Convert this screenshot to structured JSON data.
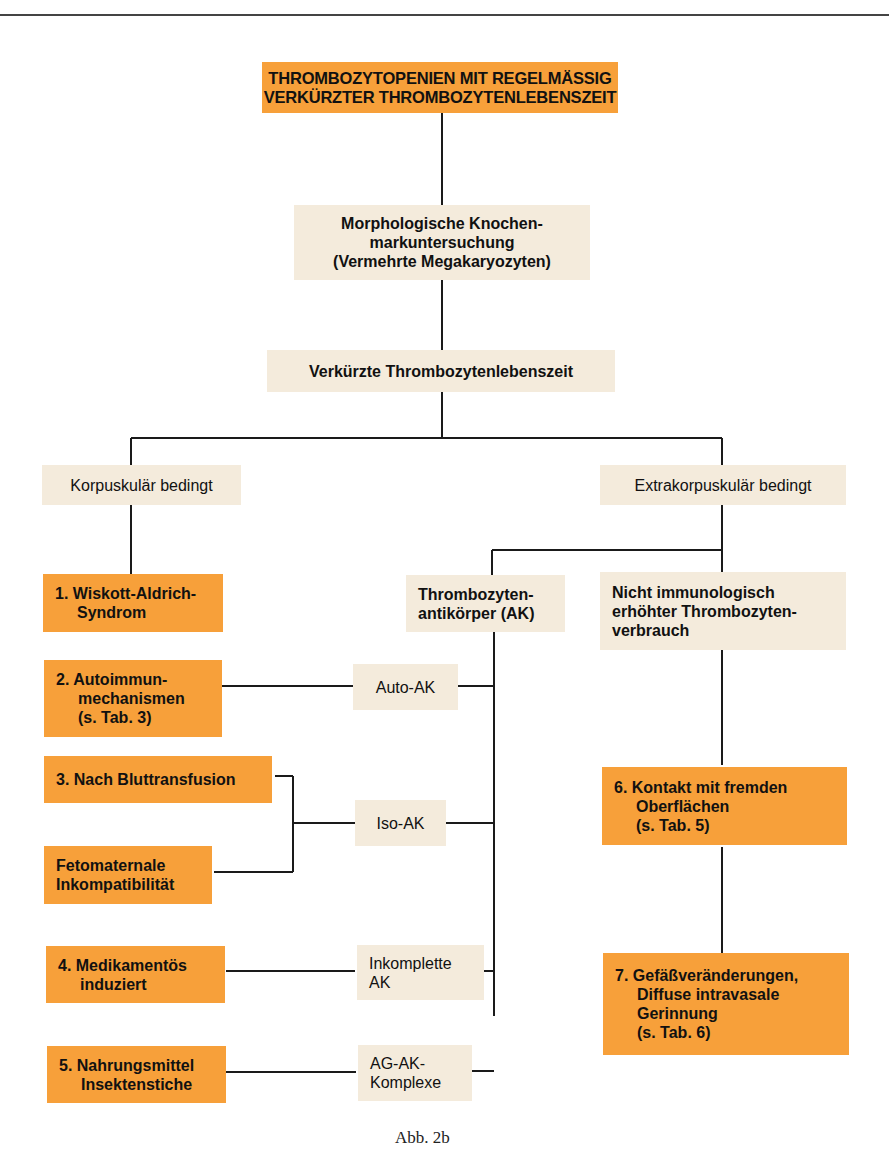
{
  "figure": {
    "caption": "Abb. 2b",
    "colors": {
      "primary_box": "#f7a03a",
      "secondary_box": "#f4ebdc",
      "line": "#1a1a1a"
    }
  },
  "nodes": {
    "root": "THROMBOZYTOPENIEN MIT REGELMÄSSIG\nVERKÜRZTER THROMBOZYTENLEBENSZEIT",
    "bone_marrow": "Morphologische Knochen-\nmarkuntersuchung\n(Vermehrte Megakaryozyten)",
    "shortened_lifespan": "Verkürzte Thrombozytenlebenszeit",
    "corpuscular": "Korpuskulär bedingt",
    "extracorpuscular": "Extrakorpuskulär bedingt",
    "antibodies": "Thrombozyten-\nantikörper (AK)",
    "non_immunological": "Nicht immunologisch\nerhöhter Thrombozyten-\nverbrauch",
    "cause_1": "1. Wiskott-Aldrich-\nSyndrom",
    "cause_2": "2. Autoimmun-\nmechanismen\n(s. Tab. 3)",
    "cause_3": "3. Nach Bluttransfusion",
    "cause_3b": "Fetomaternale\nInkompatibilität",
    "cause_4": "4. Medikamentös\ninduziert",
    "cause_5": "5. Nahrungsmittel\nInsektenstiche",
    "cause_6": "6. Kontakt mit fremden\nOberflächen\n(s. Tab. 5)",
    "cause_7": "7. Gefäßveränderungen,\nDiffuse intravasale\nGerinnung\n(s. Tab. 6)",
    "ak_auto": "Auto-AK",
    "ak_iso": "Iso-AK",
    "ak_incomplete": "Inkomplette\nAK",
    "ak_complex": "AG-AK-\nKomplexe"
  }
}
